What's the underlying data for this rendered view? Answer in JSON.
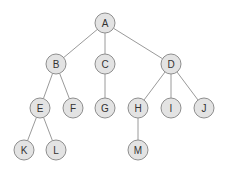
{
  "diagram": {
    "type": "tree",
    "node_radius": 10,
    "colors": {
      "node_fill": "#e3e3e3",
      "node_stroke": "#8e8e8e",
      "edge": "#9a9a9a",
      "label": "#333333"
    },
    "nodes": [
      {
        "id": "A",
        "label": "A",
        "x": 105,
        "y": 23
      },
      {
        "id": "B",
        "label": "B",
        "x": 56,
        "y": 64
      },
      {
        "id": "C",
        "label": "C",
        "x": 105,
        "y": 64
      },
      {
        "id": "D",
        "label": "D",
        "x": 171,
        "y": 64
      },
      {
        "id": "E",
        "label": "E",
        "x": 40,
        "y": 108
      },
      {
        "id": "F",
        "label": "F",
        "x": 73,
        "y": 108
      },
      {
        "id": "G",
        "label": "G",
        "x": 105,
        "y": 108
      },
      {
        "id": "H",
        "label": "H",
        "x": 138,
        "y": 108
      },
      {
        "id": "I",
        "label": "I",
        "x": 171,
        "y": 108
      },
      {
        "id": "J",
        "label": "J",
        "x": 204,
        "y": 108
      },
      {
        "id": "K",
        "label": "K",
        "x": 24,
        "y": 150
      },
      {
        "id": "L",
        "label": "L",
        "x": 56,
        "y": 150
      },
      {
        "id": "M",
        "label": "M",
        "x": 138,
        "y": 150
      }
    ],
    "edges": [
      [
        "A",
        "B"
      ],
      [
        "A",
        "C"
      ],
      [
        "A",
        "D"
      ],
      [
        "B",
        "E"
      ],
      [
        "B",
        "F"
      ],
      [
        "C",
        "G"
      ],
      [
        "D",
        "H"
      ],
      [
        "D",
        "I"
      ],
      [
        "D",
        "J"
      ],
      [
        "E",
        "K"
      ],
      [
        "E",
        "L"
      ],
      [
        "H",
        "M"
      ]
    ]
  }
}
